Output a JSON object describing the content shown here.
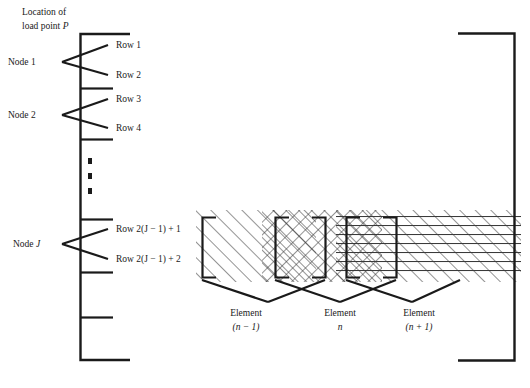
{
  "figure": {
    "title_caption": "",
    "background_color": "#ffffff",
    "ink_color": "#1a1a1a"
  },
  "left_column": {
    "annotation": {
      "line1": "Location of",
      "line2_prefix": "load point ",
      "line2_symbol": "P"
    },
    "row_labels": [
      "Row 1",
      "Row 2",
      "Row 3",
      "Row 4"
    ],
    "row_label_j1": "Row 2(J − 1) + 1",
    "row_label_j2": "Row 2(J − 1) + 2",
    "node_labels": [
      "Node 1",
      "Node 2"
    ],
    "node_label_j_prefix": "Node ",
    "node_label_j_symbol": "J",
    "vertical_ellipsis": "three-dots"
  },
  "elements_group": {
    "boxes": [
      {
        "label_line1": "Element",
        "label_line2": "(n − 1)",
        "hatch_style": "diagonal-forward",
        "symbol_italic": "n"
      },
      {
        "label_line1": "Element",
        "label_line2": "n",
        "hatch_style": "cross-hatch",
        "symbol_italic": "n"
      },
      {
        "label_line1": "Element",
        "label_line2": "(n + 1)",
        "hatch_style": "diagonal-plus-horizontal",
        "symbol_italic": "n"
      }
    ]
  },
  "brackets": {
    "left_bracket": "matrix-bracket-open",
    "right_bracket": "matrix-bracket-close"
  }
}
